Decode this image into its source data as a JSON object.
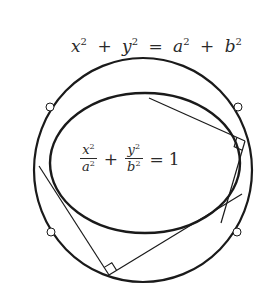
{
  "figure": {
    "circle_equation": {
      "lhs_terms": [
        "x",
        "y"
      ],
      "rhs_terms": [
        "a",
        "b"
      ],
      "exponent": "2",
      "plus": "+",
      "equals": "=",
      "text": "x² + y² = a² + b²"
    },
    "ellipse_equation": {
      "term1": {
        "numerator": "x",
        "denominator": "a",
        "exponent": "2"
      },
      "term2": {
        "numerator": "y",
        "denominator": "b",
        "exponent": "2"
      },
      "plus": "+",
      "equals": "=",
      "rhs": "1",
      "text": "x²/a² + y²/b² = 1"
    },
    "colors": {
      "stroke": "#1a1a1a",
      "text": "#2a2a2a",
      "background": "#ffffff"
    },
    "director_circle": {
      "cx": 143,
      "cy": 170,
      "rx": 109,
      "ry": 112
    },
    "ellipse": {
      "cx": 145,
      "cy": 163,
      "rx": 95,
      "ry": 70
    },
    "marked_points": [
      {
        "x": 50,
        "y": 107
      },
      {
        "x": 238,
        "y": 107
      },
      {
        "x": 51,
        "y": 232
      },
      {
        "x": 237,
        "y": 232
      }
    ],
    "tangent_pairs": [
      {
        "vertex": {
          "x": 245,
          "y": 141
        },
        "line_a_end": {
          "x": 149,
          "y": 98
        },
        "line_b_end": {
          "x": 221,
          "y": 223
        }
      },
      {
        "vertex": {
          "x": 109,
          "y": 275
        },
        "line_a_end": {
          "x": 39,
          "y": 166
        },
        "line_b_end": {
          "x": 242,
          "y": 194
        }
      }
    ]
  }
}
